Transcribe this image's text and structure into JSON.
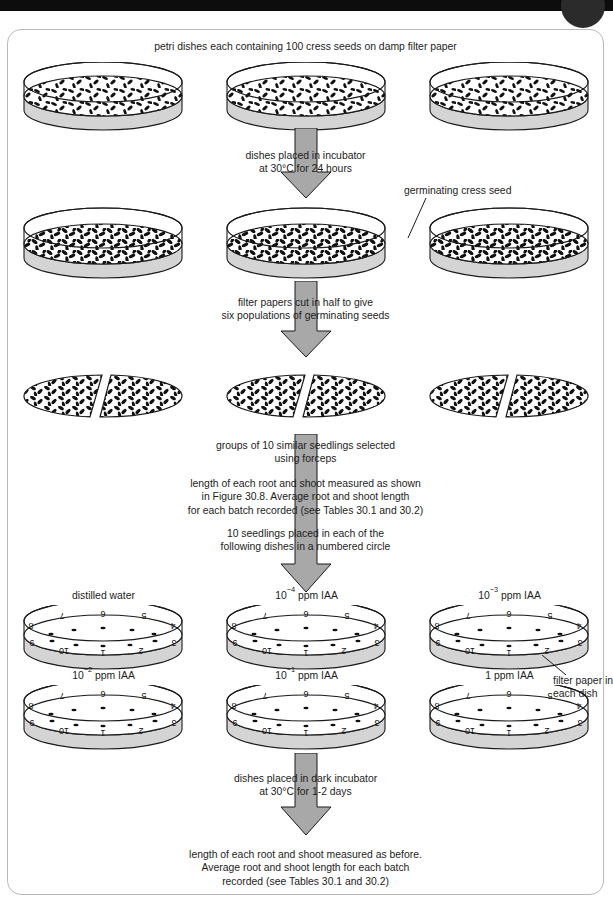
{
  "figure": {
    "domain_kind": "diagram",
    "title_caption": "petri dishes each containing 100 cress seeds on damp filter paper",
    "annotation_germinating": "germinating cress seed",
    "annotation_filter_paper": "filter paper in\neach dish",
    "steps": [
      {
        "id": "step-incubate-1",
        "text": "dishes placed in incubator\nat 30°C for 24 hours"
      },
      {
        "id": "step-cut-papers",
        "text": "filter papers cut in half to give\nsix populations of germinating seeds"
      },
      {
        "id": "step-select-seedlings",
        "text": "groups of 10 similar seedlings selected\nusing forceps"
      },
      {
        "id": "step-measure-first",
        "text": "length of each root and shoot measured as shown\nin Figure 30.8. Average root and shoot length\nfor each batch recorded (see Tables 30.1 and 30.2)"
      },
      {
        "id": "step-place-seedlings",
        "text": "10 seedlings placed in each of the\nfollowing dishes in a numbered circle"
      },
      {
        "id": "step-incubate-dark",
        "text": "dishes placed in dark incubator\nat 30°C for 1-2 days"
      },
      {
        "id": "step-measure-final",
        "text": "length of each root and shoot measured as before.\nAverage root and shoot length for each batch\nrecorded (see Tables 30.1 and 30.2)"
      }
    ],
    "treatment_dishes": [
      {
        "id": "dish-distilled-water",
        "label_html": "distilled water",
        "label_text": "distilled water"
      },
      {
        "id": "dish-iaa-1e-4",
        "label_html": "10<sup>−4</sup> ppm IAA",
        "label_text": "10^-4 ppm IAA"
      },
      {
        "id": "dish-iaa-1e-3",
        "label_html": "10<sup>−3</sup> ppm IAA",
        "label_text": "10^-3 ppm IAA"
      },
      {
        "id": "dish-iaa-1e-2",
        "label_html": "10<sup>−2</sup> ppm IAA",
        "label_text": "10^-2 ppm IAA"
      },
      {
        "id": "dish-iaa-1e-1",
        "label_html": "10<sup>−1</sup> ppm IAA",
        "label_text": "10^-1 ppm IAA"
      },
      {
        "id": "dish-iaa-1",
        "label_html": "1 ppm IAA",
        "label_text": "1 ppm IAA"
      }
    ],
    "dish_position_numbers": [
      "1",
      "2",
      "3",
      "4",
      "5",
      "6",
      "7",
      "8",
      "9",
      "10"
    ],
    "colors": {
      "arrow_fill": "#a8a8a8",
      "arrow_stroke": "#1a1a1a",
      "dish_shade": "#d4d4d4",
      "ink": "#1a1a1a",
      "frame_border": "#b9b9b9",
      "top_bar": "#0d0d0d",
      "corner_tab": "#2b2b2b"
    },
    "counts": {
      "seeds_per_dish": "100",
      "seedlings_per_dish": "10",
      "populations_after_cut": "six"
    }
  }
}
